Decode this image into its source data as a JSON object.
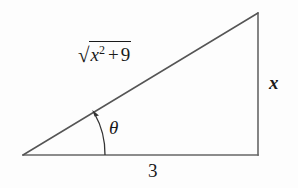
{
  "figure": {
    "type": "right-triangle-diagram",
    "background_color": "#fdfdfd",
    "stroke_color": "#555555",
    "text_color": "#1a1a1a"
  },
  "geometry": {
    "vertices": {
      "left": {
        "x": 23,
        "y": 155
      },
      "bottom_right": {
        "x": 258,
        "y": 155
      },
      "top_right": {
        "x": 258,
        "y": 13
      }
    },
    "angle_arc": {
      "center": {
        "x": 23,
        "y": 155
      },
      "start": {
        "x": 105,
        "y": 155
      },
      "end": {
        "x": 93,
        "y": 111
      },
      "arrow_at": "end"
    }
  },
  "labels": {
    "hypotenuse": {
      "name": "sqrt-x-squared-plus-9",
      "radical_sign": "√",
      "base_variable": "x",
      "exponent": "2",
      "operator": "+",
      "addend": "9",
      "plain_text": "√(x² + 9)"
    },
    "opposite_side": {
      "name": "x-label",
      "text": "x"
    },
    "adjacent_side": {
      "name": "three-label",
      "text": "3"
    },
    "angle": {
      "name": "theta-label",
      "text": "θ"
    }
  }
}
